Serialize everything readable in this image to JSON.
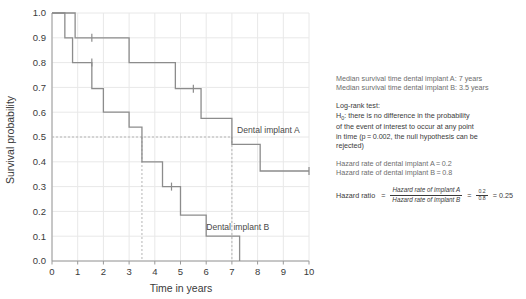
{
  "chart_data": {
    "type": "line",
    "subtype": "kaplan-meier-step",
    "title": "",
    "xlabel": "Time in years",
    "ylabel": "Survival probability",
    "xlim": [
      0,
      10
    ],
    "ylim": [
      0.0,
      1.0
    ],
    "xticks": [
      "0",
      "1",
      "2",
      "3",
      "4",
      "5",
      "6",
      "7",
      "8",
      "9",
      "10"
    ],
    "yticks": [
      "0.0",
      "0.1",
      "0.2",
      "0.3",
      "0.4",
      "0.5",
      "0.6",
      "0.7",
      "0.8",
      "0.9",
      "1.0"
    ],
    "grid": true,
    "legend_position": "inline-annotation",
    "series": [
      {
        "name": "Dental implant A",
        "color": "#8c8c8c",
        "censor_marks_x": [
          1.55,
          5.5,
          10.0
        ],
        "steps": [
          {
            "x": 0.0,
            "y": 1.0
          },
          {
            "x": 0.9,
            "y": 1.0
          },
          {
            "x": 0.9,
            "y": 0.9
          },
          {
            "x": 3.0,
            "y": 0.9
          },
          {
            "x": 3.0,
            "y": 0.8
          },
          {
            "x": 4.8,
            "y": 0.8
          },
          {
            "x": 4.8,
            "y": 0.695
          },
          {
            "x": 5.8,
            "y": 0.695
          },
          {
            "x": 5.8,
            "y": 0.575
          },
          {
            "x": 7.0,
            "y": 0.575
          },
          {
            "x": 7.0,
            "y": 0.47
          },
          {
            "x": 8.1,
            "y": 0.47
          },
          {
            "x": 8.1,
            "y": 0.363
          },
          {
            "x": 10.0,
            "y": 0.363
          }
        ]
      },
      {
        "name": "Dental implant B",
        "color": "#8c8c8c",
        "censor_marks_x": [
          1.55,
          4.65
        ],
        "steps": [
          {
            "x": 0.0,
            "y": 1.0
          },
          {
            "x": 0.5,
            "y": 1.0
          },
          {
            "x": 0.5,
            "y": 0.9
          },
          {
            "x": 0.8,
            "y": 0.9
          },
          {
            "x": 0.8,
            "y": 0.8
          },
          {
            "x": 1.55,
            "y": 0.8
          },
          {
            "x": 1.55,
            "y": 0.695
          },
          {
            "x": 2.0,
            "y": 0.695
          },
          {
            "x": 2.0,
            "y": 0.6
          },
          {
            "x": 3.0,
            "y": 0.6
          },
          {
            "x": 3.0,
            "y": 0.54
          },
          {
            "x": 3.5,
            "y": 0.54
          },
          {
            "x": 3.5,
            "y": 0.4
          },
          {
            "x": 4.3,
            "y": 0.4
          },
          {
            "x": 4.3,
            "y": 0.3
          },
          {
            "x": 5.0,
            "y": 0.3
          },
          {
            "x": 5.0,
            "y": 0.185
          },
          {
            "x": 6.0,
            "y": 0.185
          },
          {
            "x": 6.0,
            "y": 0.1
          },
          {
            "x": 7.3,
            "y": 0.1
          },
          {
            "x": 7.3,
            "y": 0.0
          }
        ]
      }
    ],
    "annotations": [
      {
        "text": "Dental implant A",
        "x": 7.2,
        "y": 0.515
      },
      {
        "text": "Dental implant B",
        "x": 6.0,
        "y": 0.125
      }
    ],
    "reference_lines": [
      {
        "orientation": "horizontal",
        "y": 0.5,
        "style": "dashed",
        "label": "median survival"
      },
      {
        "orientation": "vertical",
        "x": 3.5,
        "style": "dashed",
        "label": "median B"
      },
      {
        "orientation": "vertical",
        "x": 7.0,
        "style": "dashed",
        "label": "median A"
      }
    ]
  },
  "axis": {
    "y_label": "Survival probability",
    "x_label": "Time in years"
  },
  "series_labels": {
    "a": "Dental implant A",
    "b": "Dental implant B"
  },
  "panel": {
    "median": {
      "line_a": "Median survival time dental implant A: 7 years",
      "line_b": "Median survival time dental implant B: 3.5 years"
    },
    "logrank": {
      "heading": "Log-rank test:",
      "h0_prefix": "H",
      "h0_sub": "0",
      "h0_text": ": there is no difference in the probability",
      "line2": "of the event of interest to occur at any point",
      "line3": "in time (p = 0.002, the null hypothesis can be",
      "line4": "rejected)"
    },
    "hazard_rates": {
      "line_a": "Hazard rate of dental implant A = 0.2",
      "line_b": "Hazard rate of dental implant B = 0.8"
    },
    "hazard_ratio": {
      "label": "Hazard ratio",
      "equals": "=",
      "numerator": "Hazard rate of implant A",
      "denominator": "Hazard rate of implant B",
      "equals2": "=",
      "num_small": "0.2",
      "den_small": "0.8",
      "equals3": "=",
      "result": "0.25"
    }
  },
  "colors": {
    "curve": "#8c8c8c",
    "grid": "#e8e8e8",
    "axis": "#9a9a9a",
    "text_dark": "#3a3a3a",
    "text_muted": "#6d6d6d",
    "dashed": "#b5b5b5"
  }
}
